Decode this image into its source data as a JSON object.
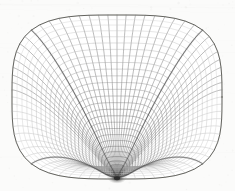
{
  "figure": {
    "name": "wireframe-mesh-surface",
    "width": 235,
    "height": 191,
    "background_color": "#fbfbfa",
    "paper_texture": true
  },
  "chart_data": {
    "type": "scatter",
    "subtitle": "",
    "xlabel": "",
    "ylabel": "",
    "render_style": "wireframe-hidden-line",
    "projection": "orthographic",
    "grid": false,
    "legend": false,
    "annotations": [],
    "surface": {
      "family": "superquadric-squircle-bowl",
      "squircle_exponent": 3.4,
      "radial_divisions": 30,
      "angular_divisions": 72,
      "profile_note": "height falls steeply near rim, flattens toward the center pole",
      "center_pole": {
        "x": 116,
        "y": 75,
        "label": "singularity"
      },
      "fold_ridges": 4,
      "ridge_angles_deg": [
        45,
        135,
        225,
        315
      ]
    },
    "camera": {
      "elevation_deg": 38,
      "azimuth_deg": 0,
      "center_x": 116,
      "center_y": 75,
      "scale_x": 104,
      "scale_y": 104,
      "vertical_squash": 0.44,
      "height_scale": 92
    },
    "bounds": {
      "left": 12,
      "right": 222,
      "top": 15,
      "bottom": 179
    },
    "colors": {
      "background": "#fbfbfa",
      "line_light": "#b9b9b7",
      "line_mid": "#8e8e8c",
      "line_dark": "#4a4a49",
      "ridge": "#3a3a39",
      "pole_core": "#2a2a2a",
      "silhouette": "#54544f"
    },
    "stroke_widths": {
      "fine": 0.42,
      "normal": 0.52,
      "ridge": 0.85,
      "silhouette": 1.0
    }
  }
}
